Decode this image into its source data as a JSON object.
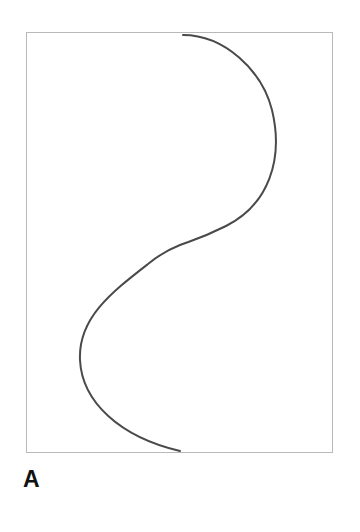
{
  "figure": {
    "panel_label": "A",
    "background_color": "#ffffff"
  },
  "panel_frame": {
    "name": "plot-border-rectangle",
    "x": 26,
    "y": 32,
    "width": 307,
    "height": 421,
    "stroke_color": "#b9b9b9",
    "stroke_width": 1,
    "fill_color": "#ffffff"
  },
  "chart_data": {
    "type": "line",
    "title": "",
    "subtitle": "",
    "xlabel": "",
    "ylabel": "",
    "annotations": [
      "A"
    ],
    "legend": [],
    "legend_position": "none",
    "grid": false,
    "axis_ticks": [],
    "tick_labels": [],
    "xlim": [
      26,
      333
    ],
    "ylim": [
      32,
      453
    ],
    "series": [
      {
        "name": "s-curve",
        "description": "smooth sigmoid (ogee) curve spanning top border to bottom border with one inflection point",
        "stroke_color": "#4a4a4a",
        "stroke_width": 2,
        "fill": "none",
        "linecap": "round",
        "x": [
          183,
          205,
          233,
          258,
          273,
          280,
          278,
          268,
          250,
          226,
          202,
          180,
          158,
          133,
          111,
          93,
          82,
          80,
          86,
          100,
          122,
          150,
          180
        ],
        "y": [
          35,
          37,
          46,
          66,
          94,
          126,
          155,
          182,
          205,
          226,
          239,
          245,
          251,
          262,
          281,
          307,
          335,
          360,
          384,
          405,
          424,
          441,
          451
        ],
        "path_d": "M 183 35 C 224 35 262 70 272 110 C 284 160 268 205 226 226 C 200 239 190 241 180 245 C 170 249 160 254 148 264 C 112 292 78 318 80 360 C 82 402 120 437 180 451"
      }
    ]
  }
}
